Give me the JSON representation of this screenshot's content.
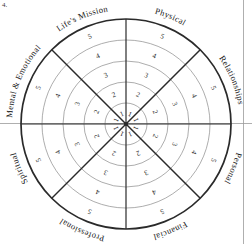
{
  "figure": {
    "corner_mark": "4.",
    "center_x": 126,
    "center_y": 124,
    "outer_radius": 105,
    "ring_count": 5,
    "sector_count": 8,
    "colors": {
      "outer_circle": "#2a2a2a",
      "ring_line": "#8a8a8a",
      "divider_line": "#2a2a2a",
      "text": "#171717",
      "page_border": "#9a9a9a",
      "background": "#ffffff"
    }
  },
  "sectors": [
    {
      "id": "physical",
      "label": "Physical",
      "start_deg": 270,
      "end_deg": 315,
      "label_angle_deg": 292.5,
      "divider_style": "thin"
    },
    {
      "id": "relationships",
      "label": "Relationships",
      "start_deg": 315,
      "end_deg": 360,
      "label_angle_deg": 337.5,
      "divider_style": "thick"
    },
    {
      "id": "personal",
      "label": "Personal",
      "start_deg": 0,
      "end_deg": 45,
      "label_angle_deg": 22.5,
      "divider_style": "thin"
    },
    {
      "id": "financial",
      "label": "Financial",
      "start_deg": 45,
      "end_deg": 90,
      "label_angle_deg": 67.5,
      "divider_style": "thick"
    },
    {
      "id": "professional",
      "label": "Professional",
      "start_deg": 90,
      "end_deg": 135,
      "label_angle_deg": 112.5,
      "divider_style": "thin"
    },
    {
      "id": "spiritual",
      "label": "Spiritual",
      "start_deg": 135,
      "end_deg": 180,
      "label_angle_deg": 157.5,
      "divider_style": "thick"
    },
    {
      "id": "mental-emotional",
      "label": "Mental & Emotional",
      "start_deg": 180,
      "end_deg": 225,
      "label_angle_deg": 202.5,
      "divider_style": "thin"
    },
    {
      "id": "lifes-mission",
      "label": "Life's Mission",
      "start_deg": 225,
      "end_deg": 270,
      "label_angle_deg": 247.5,
      "divider_style": "thick"
    }
  ],
  "ring_scale": {
    "values": [
      1,
      2,
      3,
      4,
      5
    ],
    "labels": [
      "1",
      "2",
      "3",
      "4",
      "5"
    ],
    "radii": [
      21,
      42,
      63,
      84,
      105
    ],
    "description": "Scale rings numbered 1 at centre to 5 at outer edge, repeated in every sector"
  },
  "chart_data": {
    "type": "pie",
    "categories": [
      "Physical",
      "Relationships",
      "Personal",
      "Financial",
      "Professional",
      "Spiritual",
      "Mental & Emotional",
      "Life's Mission"
    ],
    "values": [
      1,
      1,
      1,
      1,
      1,
      1,
      1,
      1
    ],
    "scale_min": 1,
    "scale_max": 5,
    "scale_ticks": [
      "1",
      "2",
      "3",
      "4",
      "5"
    ],
    "xlabel": "",
    "ylabel": "",
    "legend": "none",
    "grid": true
  }
}
